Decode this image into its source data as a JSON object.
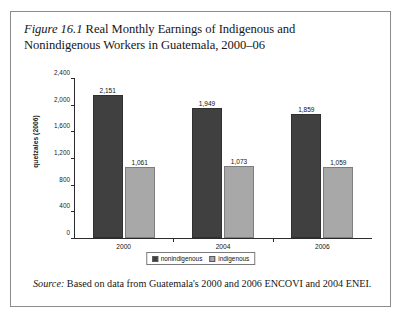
{
  "figure": {
    "label": "Figure 16.1",
    "title": "Real Monthly Earnings of Indigenous and Nonindigenous Workers in Guatemala, 2000–06"
  },
  "source": {
    "label": "Source:",
    "text": "Based on data from Guatemala's 2000 and 2006 ENCOVI and 2004 ENEI."
  },
  "legend": {
    "items": [
      {
        "label": "nonindigenous",
        "color": "#404040"
      },
      {
        "label": "indigenous",
        "color": "#a8a8a8"
      }
    ]
  },
  "chart_data": {
    "type": "bar",
    "title": "Real Monthly Earnings of Indigenous and Nonindigenous Workers in Guatemala, 2000–06",
    "xlabel": "",
    "ylabel": "quetzales (2006)",
    "ylim": [
      0,
      2400
    ],
    "yticks": [
      0,
      400,
      800,
      1200,
      1600,
      2000,
      2400
    ],
    "ytick_labels": [
      "0",
      "400",
      "800",
      "1,200",
      "1,600",
      "2,000",
      "2,400"
    ],
    "categories": [
      "2000",
      "2004",
      "2006"
    ],
    "grid": false,
    "legend_position": "bottom",
    "series": [
      {
        "name": "nonindigenous",
        "color": "#404040",
        "values": [
          2151,
          1949,
          1859
        ],
        "value_labels": [
          "2,151",
          "1,949",
          "1,859"
        ]
      },
      {
        "name": "indigenous",
        "color": "#a8a8a8",
        "values": [
          1061,
          1073,
          1059
        ],
        "value_labels": [
          "1,061",
          "1,073",
          "1,059"
        ]
      }
    ]
  }
}
